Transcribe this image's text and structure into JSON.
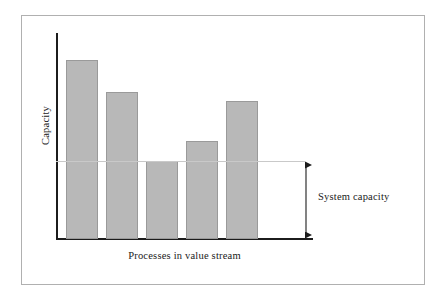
{
  "figure": {
    "background": "#ffffff",
    "frame_color": "#b0b0b0"
  },
  "chart_data": {
    "type": "bar",
    "title": "",
    "subtitle": "",
    "xlabel": "Processes in value stream",
    "ylabel": "Capacity",
    "categories": [
      "1",
      "2",
      "3",
      "4",
      "5"
    ],
    "values": [
      179,
      147,
      78,
      98,
      138
    ],
    "ylim": [
      0,
      206
    ],
    "grid": false,
    "legend": null,
    "bar_color": "#b8b8b8",
    "bar_edge_color": "#9a9a9a",
    "axis_color": "#1c1c1c",
    "tick_labels_x": [],
    "tick_labels_y": [],
    "annotations": [
      {
        "label": "System capacity",
        "type": "double-headed-arrow",
        "reference_line_value": 78,
        "reference_line_color": "#c9c9c9",
        "spans_from": 0,
        "spans_to": 78,
        "description": "Horizontal reference line drawn at the height of the shortest bar (the bottleneck process), with a vertical double-headed arrow from the baseline up to that line indicating the overall system capacity."
      }
    ]
  },
  "labels": {
    "y_axis_title": "Capacity",
    "x_axis_title": "Processes in value stream",
    "system_capacity": "System capacity"
  }
}
